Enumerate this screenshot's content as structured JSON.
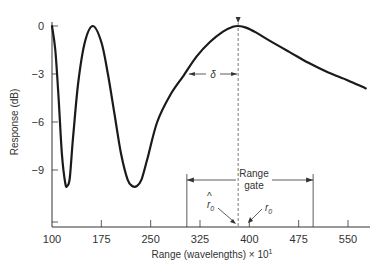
{
  "chart_data": {
    "type": "line",
    "title": "",
    "xlabel": "Range (wavelengths) × 10¹",
    "ylabel": "Response (dB)",
    "xlim": [
      100,
      580
    ],
    "ylim": [
      -12.5,
      0
    ],
    "grid": false,
    "x_ticks": [
      100,
      175,
      250,
      325,
      400,
      475,
      550
    ],
    "x_tick_labels": [
      "100",
      "175",
      "250",
      "325",
      "400",
      "475",
      "550"
    ],
    "y_ticks": [
      0,
      -3,
      -6,
      -9
    ],
    "y_tick_labels": [
      "0",
      "-3",
      "-6",
      "-9"
    ],
    "series": [
      {
        "name": "Response",
        "x": [
          100,
          105,
          110,
          115,
          120,
          123,
          127,
          132,
          140,
          150,
          162,
          175,
          185,
          195,
          205,
          215,
          222,
          229,
          236,
          245,
          260,
          280,
          300,
          320,
          340,
          360,
          375,
          383,
          395,
          410,
          430,
          460,
          490,
          520,
          550,
          577
        ],
        "y": [
          0,
          -1.5,
          -4.5,
          -8,
          -9.8,
          -10,
          -9.5,
          -7,
          -3.5,
          -1,
          0,
          -1,
          -3,
          -5.5,
          -8,
          -9.6,
          -10,
          -10,
          -9.6,
          -8.3,
          -6,
          -4.3,
          -3.1,
          -1.9,
          -1,
          -0.35,
          -0.05,
          0,
          -0.1,
          -0.4,
          -0.9,
          -1.6,
          -2.3,
          -2.9,
          -3.4,
          -3.9
        ]
      }
    ],
    "annotations": [
      {
        "type": "vertical-dashed",
        "x": 383,
        "label": "r̂₀"
      },
      {
        "type": "marker",
        "x": 400,
        "label": "r₀"
      },
      {
        "type": "double-arrow",
        "label": "δ",
        "x_from": 305,
        "x_to": 383,
        "y": -3
      },
      {
        "type": "range-gate",
        "label_line1": "Range",
        "label_line2": "gate",
        "x_from": 305,
        "x_to": 497
      }
    ]
  },
  "labels": {
    "x_axis_title": "Range (wavelengths) × 10",
    "x_axis_exp": "1",
    "y_axis_title": "Response (dB)",
    "delta": "δ",
    "gate_line1": "Range",
    "gate_line2": "gate",
    "r0_hat": "r",
    "r0_hat_sub": "0",
    "r0": "r",
    "r0_sub": "0",
    "hat": "^"
  }
}
